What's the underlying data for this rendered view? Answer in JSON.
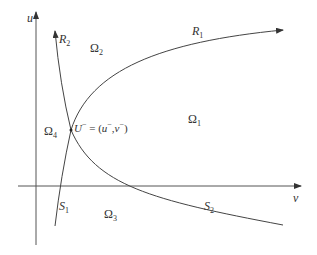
{
  "axes": {
    "vertical_label": "u",
    "horizontal_label": "v"
  },
  "curves": {
    "R1": {
      "name": "R",
      "sub": "1"
    },
    "R2": {
      "name": "R",
      "sub": "2"
    },
    "S1": {
      "name": "S",
      "sub": "1"
    },
    "S2": {
      "name": "S",
      "sub": "2"
    }
  },
  "regions": {
    "omega1": {
      "name": "Ω",
      "sub": "1"
    },
    "omega2": {
      "name": "Ω",
      "sub": "2"
    },
    "omega3": {
      "name": "Ω",
      "sub": "3"
    },
    "omega4": {
      "name": "Ω",
      "sub": "4"
    }
  },
  "point": {
    "name": "U",
    "sup": "−",
    "eq": " = (",
    "u": "u",
    "u_sup": "−",
    "comma": ",",
    "v": "v",
    "v_sup": "−",
    "close": ")"
  },
  "colors": {
    "line": "#444444",
    "text": "#333333"
  }
}
